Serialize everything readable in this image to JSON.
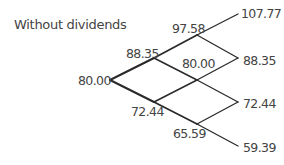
{
  "title": "Without dividends",
  "tree": {
    "steps": 3,
    "nodes": [
      {
        "id": "n0",
        "value": "80.00",
        "x": 110,
        "y": 80
      },
      {
        "id": "u1",
        "value": "88.35",
        "x": 154,
        "y": 58
      },
      {
        "id": "d1",
        "value": "72.44",
        "x": 154,
        "y": 102
      },
      {
        "id": "uu2",
        "value": "97.58",
        "x": 197,
        "y": 35
      },
      {
        "id": "ud2",
        "value": "80.00",
        "x": 197,
        "y": 80
      },
      {
        "id": "dd2",
        "value": "65.59",
        "x": 197,
        "y": 124
      },
      {
        "id": "uuu3",
        "value": "107.77",
        "x": 238,
        "y": 14
      },
      {
        "id": "uud3",
        "value": "88.35",
        "x": 238,
        "y": 58
      },
      {
        "id": "udd3",
        "value": "72.44",
        "x": 238,
        "y": 102
      },
      {
        "id": "ddd3",
        "value": "59.39",
        "x": 238,
        "y": 146
      }
    ],
    "line_color": "#2a2a2a"
  }
}
